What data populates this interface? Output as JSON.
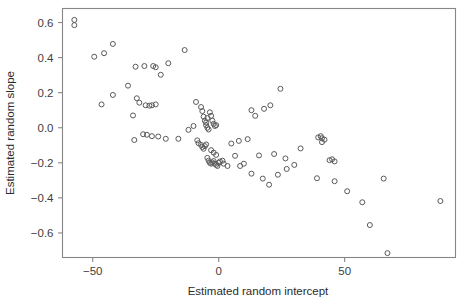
{
  "chart_data": {
    "type": "scatter",
    "title": "",
    "xlabel": "Estimated random intercept",
    "ylabel": "Estimated random slope",
    "xlim": [
      -62,
      94
    ],
    "ylim": [
      -0.74,
      0.68
    ],
    "xticks": [
      -50,
      0,
      50
    ],
    "xtick_labels": [
      "−50",
      "0",
      "50"
    ],
    "yticks": [
      0.6,
      0.4,
      0.2,
      0.0,
      -0.2,
      -0.4,
      -0.6
    ],
    "ytick_labels": [
      "0.6",
      "0.4",
      "0.2",
      "0.0",
      "−0.2",
      "−0.4",
      "−0.6"
    ],
    "grid": false,
    "legend": "none",
    "marker": "open-circle",
    "marker_color": "#5a5a5a",
    "frame_color": "#868686",
    "n_points": 105,
    "points": [
      [
        -57.3,
        0.615
      ],
      [
        -57.3,
        0.585
      ],
      [
        -49.4,
        0.405
      ],
      [
        -45.5,
        0.425
      ],
      [
        -42.0,
        0.478
      ],
      [
        -46.5,
        0.133
      ],
      [
        -42.0,
        0.187
      ],
      [
        -36.0,
        0.24
      ],
      [
        -33.0,
        0.348
      ],
      [
        -29.5,
        0.352
      ],
      [
        -26.0,
        0.352
      ],
      [
        -25.0,
        0.345
      ],
      [
        -23.0,
        0.302
      ],
      [
        -20.0,
        0.368
      ],
      [
        -13.5,
        0.443
      ],
      [
        -32.5,
        0.168
      ],
      [
        -31.5,
        0.143
      ],
      [
        -29.0,
        0.128
      ],
      [
        -27.5,
        0.126
      ],
      [
        -26.5,
        0.128
      ],
      [
        -25.0,
        0.133
      ],
      [
        -34.0,
        0.07
      ],
      [
        -33.5,
        -0.07
      ],
      [
        -30.0,
        -0.037
      ],
      [
        -28.5,
        -0.04
      ],
      [
        -26.5,
        -0.048
      ],
      [
        -24.0,
        -0.05
      ],
      [
        -21.0,
        -0.063
      ],
      [
        -16.0,
        -0.063
      ],
      [
        -12.0,
        -0.012
      ],
      [
        -10.0,
        0.01
      ],
      [
        -9.0,
        0.147
      ],
      [
        -7.0,
        0.118
      ],
      [
        -6.5,
        0.095
      ],
      [
        -6.0,
        0.063
      ],
      [
        -5.5,
        0.04
      ],
      [
        -5.0,
        0.03
      ],
      [
        -5.0,
        0.015
      ],
      [
        -4.5,
        0.0
      ],
      [
        -4.0,
        -0.01
      ],
      [
        -4.5,
        0.055
      ],
      [
        -3.5,
        0.088
      ],
      [
        -3.0,
        0.068
      ],
      [
        -2.5,
        0.04
      ],
      [
        -2.0,
        0.022
      ],
      [
        -1.5,
        0.01
      ],
      [
        -1.0,
        0.015
      ],
      [
        -8.5,
        -0.072
      ],
      [
        -8.0,
        -0.088
      ],
      [
        -7.0,
        -0.098
      ],
      [
        -6.5,
        -0.11
      ],
      [
        -6.0,
        -0.12
      ],
      [
        -5.5,
        -0.105
      ],
      [
        -5.0,
        -0.095
      ],
      [
        -3.0,
        -0.128
      ],
      [
        -2.0,
        -0.142
      ],
      [
        -1.0,
        -0.155
      ],
      [
        -4.5,
        -0.172
      ],
      [
        -4.0,
        -0.188
      ],
      [
        -3.5,
        -0.2
      ],
      [
        -3.0,
        -0.205
      ],
      [
        -2.5,
        -0.198
      ],
      [
        -2.0,
        -0.19
      ],
      [
        -1.5,
        -0.205
      ],
      [
        -1.0,
        -0.212
      ],
      [
        -0.5,
        -0.218
      ],
      [
        0.0,
        -0.2
      ],
      [
        0.5,
        -0.192
      ],
      [
        1.5,
        -0.188
      ],
      [
        2.0,
        -0.205
      ],
      [
        3.5,
        -0.218
      ],
      [
        6.5,
        -0.16
      ],
      [
        8.5,
        -0.218
      ],
      [
        10.0,
        -0.205
      ],
      [
        5.0,
        -0.09
      ],
      [
        8.0,
        -0.075
      ],
      [
        11.5,
        -0.065
      ],
      [
        13.0,
        0.1
      ],
      [
        14.5,
        0.068
      ],
      [
        18.0,
        0.108
      ],
      [
        20.5,
        0.128
      ],
      [
        24.5,
        0.222
      ],
      [
        13.0,
        -0.262
      ],
      [
        17.5,
        -0.29
      ],
      [
        20.0,
        -0.325
      ],
      [
        23.5,
        -0.268
      ],
      [
        27.0,
        -0.235
      ],
      [
        30.0,
        -0.212
      ],
      [
        16.0,
        -0.158
      ],
      [
        22.0,
        -0.15
      ],
      [
        26.5,
        -0.175
      ],
      [
        32.5,
        -0.118
      ],
      [
        39.5,
        -0.055
      ],
      [
        40.5,
        -0.048
      ],
      [
        41.0,
        -0.06
      ],
      [
        42.0,
        -0.068
      ],
      [
        41.0,
        -0.082
      ],
      [
        44.0,
        -0.185
      ],
      [
        45.0,
        -0.18
      ],
      [
        46.0,
        -0.192
      ],
      [
        39.0,
        -0.288
      ],
      [
        46.0,
        -0.305
      ],
      [
        51.0,
        -0.362
      ],
      [
        57.0,
        -0.425
      ],
      [
        60.0,
        -0.555
      ],
      [
        65.5,
        -0.29
      ],
      [
        67.0,
        -0.715
      ],
      [
        88.0,
        -0.418
      ]
    ]
  },
  "axes": {
    "x_label": "Estimated random intercept",
    "y_label": "Estimated random slope"
  }
}
